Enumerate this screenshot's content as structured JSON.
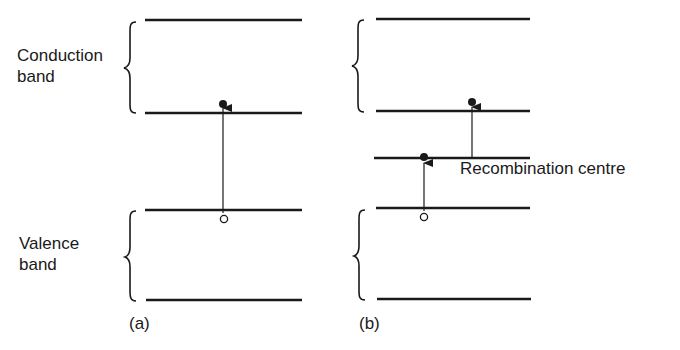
{
  "figure": {
    "panel_a": {
      "caption": "(a)",
      "conduction_band_label_line1": "Conduction",
      "conduction_band_label_line2": "band",
      "valence_band_label_line1": "Valence",
      "valence_band_label_line2": "band",
      "transition": "direct band-to-band: electron (filled dot) at conduction band edge, hole (open circle) at valence band edge"
    },
    "panel_b": {
      "caption": "(b)",
      "recombination_label": "Recombination centre",
      "transitions": [
        "valence band edge to recombination centre level",
        "recombination centre level to conduction band edge"
      ]
    },
    "colors": {
      "line": "#1a1a1a",
      "background": "#ffffff"
    }
  }
}
